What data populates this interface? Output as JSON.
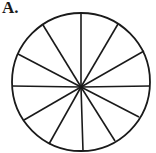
{
  "figure": {
    "label": "A.",
    "shape": "circle",
    "sectors": 12,
    "center": [
      81,
      87
    ],
    "radius": 69,
    "spoke_endpoints": [
      [
        81,
        13
      ],
      [
        118,
        24
      ],
      [
        144,
        51
      ],
      [
        150,
        86
      ],
      [
        139,
        117
      ],
      [
        115,
        141
      ],
      [
        83,
        151
      ],
      [
        49,
        144
      ],
      [
        24,
        120
      ],
      [
        12,
        86
      ],
      [
        18,
        54
      ],
      [
        43,
        25
      ]
    ],
    "stroke_color": "#1a1a1a",
    "background_color": "#ffffff"
  }
}
